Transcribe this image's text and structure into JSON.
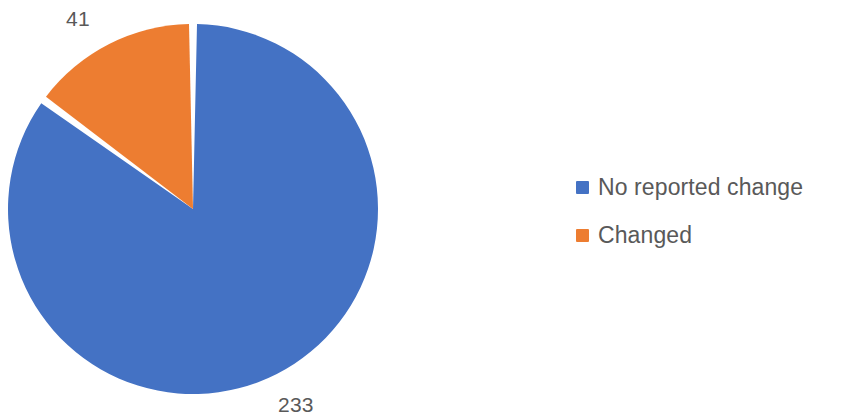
{
  "chart_data": {
    "type": "pie",
    "title": "",
    "subtitle": "",
    "xlabel": "",
    "ylabel": "",
    "categories": [
      "No reported change",
      "Changed"
    ],
    "values": [
      233,
      41
    ],
    "data_labels": [
      "233",
      "41"
    ],
    "total": 274,
    "colors": [
      "#4472C4",
      "#ED7D31"
    ],
    "legend_position": "right",
    "grid": false,
    "start_angle_deg": 0,
    "direction": "clockwise",
    "slice_gap": true,
    "slices": [
      {
        "name": "No reported change",
        "value": 233,
        "label": "233",
        "color": "#4472C4",
        "percent": 85.04,
        "sweep_deg": 306.13,
        "start_deg": 0,
        "end_deg": 306.13
      },
      {
        "name": "Changed",
        "value": 41,
        "label": "41",
        "color": "#ED7D31",
        "percent": 14.96,
        "sweep_deg": 53.87,
        "start_deg": 306.13,
        "end_deg": 360
      }
    ]
  },
  "geometry": {
    "center_x": 193,
    "center_y": 209,
    "radius": 185,
    "separator_color": "#FFFFFF",
    "separator_width": 4
  },
  "legend": {
    "items": [
      {
        "label": "No reported change",
        "color": "#4472C4",
        "marker": "square-swatch"
      },
      {
        "label": "Changed",
        "color": "#ED7D31",
        "marker": "square-swatch"
      }
    ]
  },
  "style": {
    "label_text_color": "#595959",
    "background": "#FFFFFF"
  }
}
